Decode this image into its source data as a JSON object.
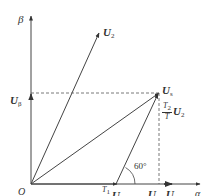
{
  "diagram": {
    "type": "vector-diagram",
    "axes": {
      "x_label": "α",
      "y_label": "β",
      "origin_label": "O"
    },
    "vectors": {
      "U2": {
        "label": "U",
        "subscript": "2"
      },
      "Us": {
        "label": "U",
        "subscript": "s"
      },
      "U1": {
        "label": "U",
        "subscript": "1"
      }
    },
    "projections": {
      "u_beta": {
        "label": "U",
        "subscript": "β"
      },
      "u_alpha": {
        "label": "U",
        "subscript": "α"
      }
    },
    "components": {
      "t1_u1": {
        "num": "T",
        "num_sub": "1",
        "den": "T",
        "vec": "U",
        "vec_sub": "1"
      },
      "t2_u2": {
        "num": "T",
        "num_sub": "2",
        "den": "T",
        "vec": "U",
        "vec_sub": "2"
      }
    },
    "angle_label": "60°",
    "colors": {
      "line": "#444444",
      "dashed": "#555555",
      "text": "#333333"
    }
  }
}
